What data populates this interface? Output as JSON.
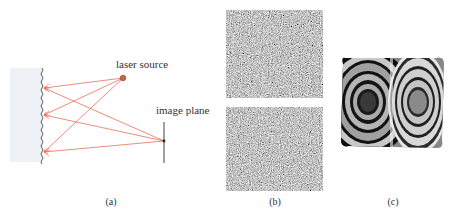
{
  "figure": {
    "panels": [
      {
        "id": "a",
        "caption": "(a)",
        "description": "laser speckle formation from a rough surface",
        "labels": {
          "laser_source": "laser source",
          "image_plane": "image plane"
        },
        "colors": {
          "ray": "#ea6f57",
          "laser_dot": "#d9603f",
          "surface_fill": "#eef1f6",
          "surface_edge": "#333333",
          "image_plane_line": "#444444"
        }
      },
      {
        "id": "b",
        "caption": "(b)",
        "description": "two speckle pattern images"
      },
      {
        "id": "c",
        "caption": "(c)",
        "description": "phase fringe pattern with two sets of concentric rings"
      }
    ]
  }
}
